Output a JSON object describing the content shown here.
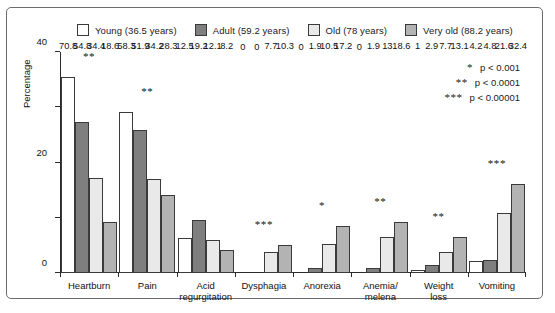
{
  "chart_data": {
    "type": "bar",
    "title": "",
    "xlabel": "",
    "ylabel": "Percentage",
    "ylim": [
      0,
      80
    ],
    "yticks": [
      0,
      20,
      40,
      60,
      80
    ],
    "grid": false,
    "legend_position": "top",
    "categories": [
      "Heartburn",
      "Pain",
      "Acid regurgitation",
      "Dysphagia",
      "Anorexia",
      "Anemia/ melena",
      "Weight loss",
      "Vomiting"
    ],
    "series": [
      {
        "name": "Young (36.5 years)",
        "color": "#ffffff",
        "values": [
          70.8,
          58.3,
          12.5,
          0,
          0,
          0,
          1,
          4.2
        ]
      },
      {
        "name": "Adult (59.2 years)",
        "color": "#7f7f7f",
        "values": [
          54.8,
          51.9,
          19.2,
          0,
          1.9,
          1.9,
          2.9,
          4.8
        ]
      },
      {
        "name": "Old (78 years)",
        "color": "#e9e9e9",
        "values": [
          34.4,
          34.2,
          12.1,
          7.7,
          10.5,
          13,
          7.7,
          21.6
        ]
      },
      {
        "name": "Very old (88.2 years)",
        "color": "#b3b3b3",
        "values": [
          18.6,
          28.3,
          8.2,
          10.3,
          17.2,
          18.6,
          13.1,
          32.4
        ]
      }
    ],
    "value_labels": [
      [
        "70.8",
        "54.8",
        "34.4",
        "18.6"
      ],
      [
        "58.3",
        "51.9",
        "34.2",
        "28.3"
      ],
      [
        "12.5",
        "19.2",
        "12.1",
        "8.2"
      ],
      [
        "0",
        "0",
        "7.7",
        "10.3"
      ],
      [
        "0",
        "1.9",
        "10.5",
        "17.2"
      ],
      [
        "0",
        "1.9",
        "13",
        "18.6"
      ],
      [
        "1",
        "2.9",
        "7.7",
        "13.1"
      ],
      [
        "4.2",
        "4.8",
        "21.6",
        "32.4"
      ]
    ],
    "significance": [
      "**",
      "**",
      "",
      "***",
      "*",
      "**",
      "**",
      "***"
    ],
    "significance_key": [
      {
        "star": "*",
        "text": "p < 0.001"
      },
      {
        "star": "**",
        "text": "p < 0.0001"
      },
      {
        "star": "***",
        "text": "p < 0.00001"
      }
    ]
  }
}
